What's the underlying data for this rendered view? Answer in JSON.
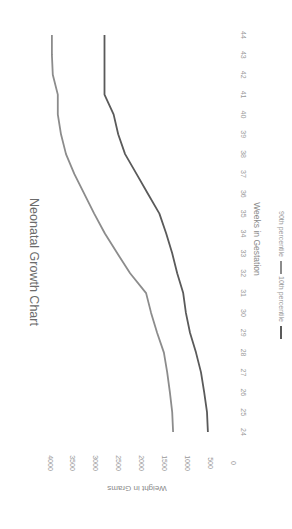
{
  "chart_data": {
    "type": "line",
    "title": "Neonatal Growth Chart",
    "xlabel": "Weeks in Gestation",
    "ylabel": "Weight in Grams",
    "orientation": "rotated 90° clockwise",
    "x": [
      24,
      25,
      26,
      27,
      28,
      29,
      30,
      31,
      32,
      33,
      34,
      35,
      36,
      37,
      38,
      39,
      40,
      41,
      42,
      43,
      44
    ],
    "ylim": [
      0,
      4000
    ],
    "yticks": [
      0,
      500,
      1000,
      1500,
      2000,
      2500,
      3000,
      3500,
      4000
    ],
    "grid": false,
    "legend_position": "bottom",
    "series": [
      {
        "name": "10th percentile",
        "color": "#5a5a5a",
        "values": [
          440,
          460,
          520,
          590,
          700,
          830,
          920,
          980,
          1110,
          1220,
          1350,
          1500,
          1750,
          2000,
          2250,
          2400,
          2500,
          2700,
          2700,
          2700,
          2700
        ]
      },
      {
        "name": "90th percentile",
        "color": "#8c8c8c",
        "values": [
          1200,
          1220,
          1270,
          1330,
          1400,
          1550,
          1680,
          1790,
          2140,
          2420,
          2690,
          2925,
          3140,
          3360,
          3540,
          3650,
          3720,
          3720,
          3830,
          3850,
          3850
        ]
      }
    ]
  }
}
